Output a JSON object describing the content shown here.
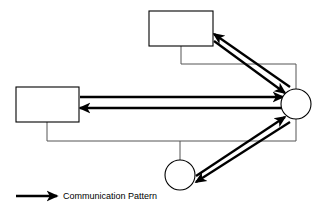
{
  "diagram": {
    "background_color": "#ffffff",
    "line_color": "#000000",
    "bus_color": "#555555",
    "nodes": [
      {
        "id": "top-box",
        "type": "rectangle",
        "label": "",
        "x": 149,
        "y": 11,
        "width": 64,
        "height": 35
      },
      {
        "id": "left-box",
        "type": "rectangle",
        "label": "",
        "x": 16,
        "y": 87,
        "width": 63,
        "height": 35
      },
      {
        "id": "right-circle",
        "type": "circle",
        "label": "",
        "cx": 296,
        "cy": 104,
        "r": 15
      },
      {
        "id": "bottom-circle",
        "type": "circle",
        "label": "",
        "cx": 180,
        "cy": 175,
        "r": 15
      }
    ],
    "bus_segments": [
      {
        "id": "bus-top-stub",
        "points": "181,46 181,64"
      },
      {
        "id": "bus-top-run",
        "points": "181,64 296,64 296,89"
      },
      {
        "id": "bus-left-stub",
        "points": "47,122 47,141"
      },
      {
        "id": "bus-bottom-run",
        "points": "47,141 296,141 296,119"
      },
      {
        "id": "bus-bottom-stub",
        "points": "180,141 180,160"
      }
    ],
    "communication_arrows": [
      {
        "id": "arrow-top-box-to-circle",
        "from": "top-box",
        "to": "right-circle",
        "direction": "down-right",
        "x1": 214,
        "y1": 41,
        "x2": 285,
        "y2": 93
      },
      {
        "id": "arrow-circle-to-top-box",
        "from": "right-circle",
        "to": "top-box",
        "direction": "up-left",
        "x1": 290,
        "y1": 87,
        "x2": 214,
        "y2": 34
      },
      {
        "id": "arrow-left-box-to-circle",
        "from": "left-box",
        "to": "right-circle",
        "direction": "right",
        "x1": 80,
        "y1": 97,
        "x2": 283,
        "y2": 97
      },
      {
        "id": "arrow-circle-to-left-box",
        "from": "right-circle",
        "to": "left-box",
        "direction": "left",
        "x1": 283,
        "y1": 108,
        "x2": 80,
        "y2": 108
      },
      {
        "id": "arrow-bottom-circle-to-circle",
        "from": "bottom-circle",
        "to": "right-circle",
        "direction": "up-right",
        "x1": 196,
        "y1": 176,
        "x2": 285,
        "y2": 117
      },
      {
        "id": "arrow-circle-to-bottom-circle",
        "from": "right-circle",
        "to": "bottom-circle",
        "direction": "down-left",
        "x1": 290,
        "y1": 122,
        "x2": 196,
        "y2": 182
      }
    ]
  },
  "legend": {
    "label": "Communication Pattern",
    "arrow_icon": "right-arrow-icon",
    "arrow": {
      "x1": 16,
      "y1": 196,
      "x2": 57,
      "y2": 196
    },
    "text_x": 63,
    "text_y": 196
  }
}
